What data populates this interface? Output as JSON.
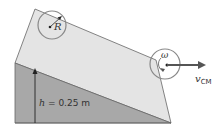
{
  "diagram": {
    "top_object": {
      "label": "R",
      "radius_label": "R"
    },
    "bottom_object": {
      "omega_label": "ω",
      "velocity_label": "v",
      "velocity_subscript": "CM"
    },
    "height": {
      "symbol": "h",
      "equals": " = ",
      "value": "0.25 m"
    },
    "colors": {
      "top_face": "#e4e4e4",
      "front_face": "#a8a8a8",
      "edge": "#555555",
      "arrow": "#555555",
      "circle_stroke": "#888888"
    }
  }
}
